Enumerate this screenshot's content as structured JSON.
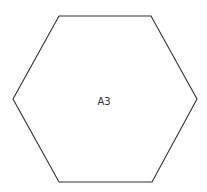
{
  "diagram": {
    "shape": "hexagon",
    "stroke_color": "#333333",
    "fill_color": "#ffffff",
    "vertices": [
      [
        59,
        16
      ],
      [
        151,
        16
      ],
      [
        197,
        99
      ],
      [
        152,
        182
      ],
      [
        59,
        182
      ],
      [
        13,
        99
      ]
    ],
    "label": "A3"
  }
}
